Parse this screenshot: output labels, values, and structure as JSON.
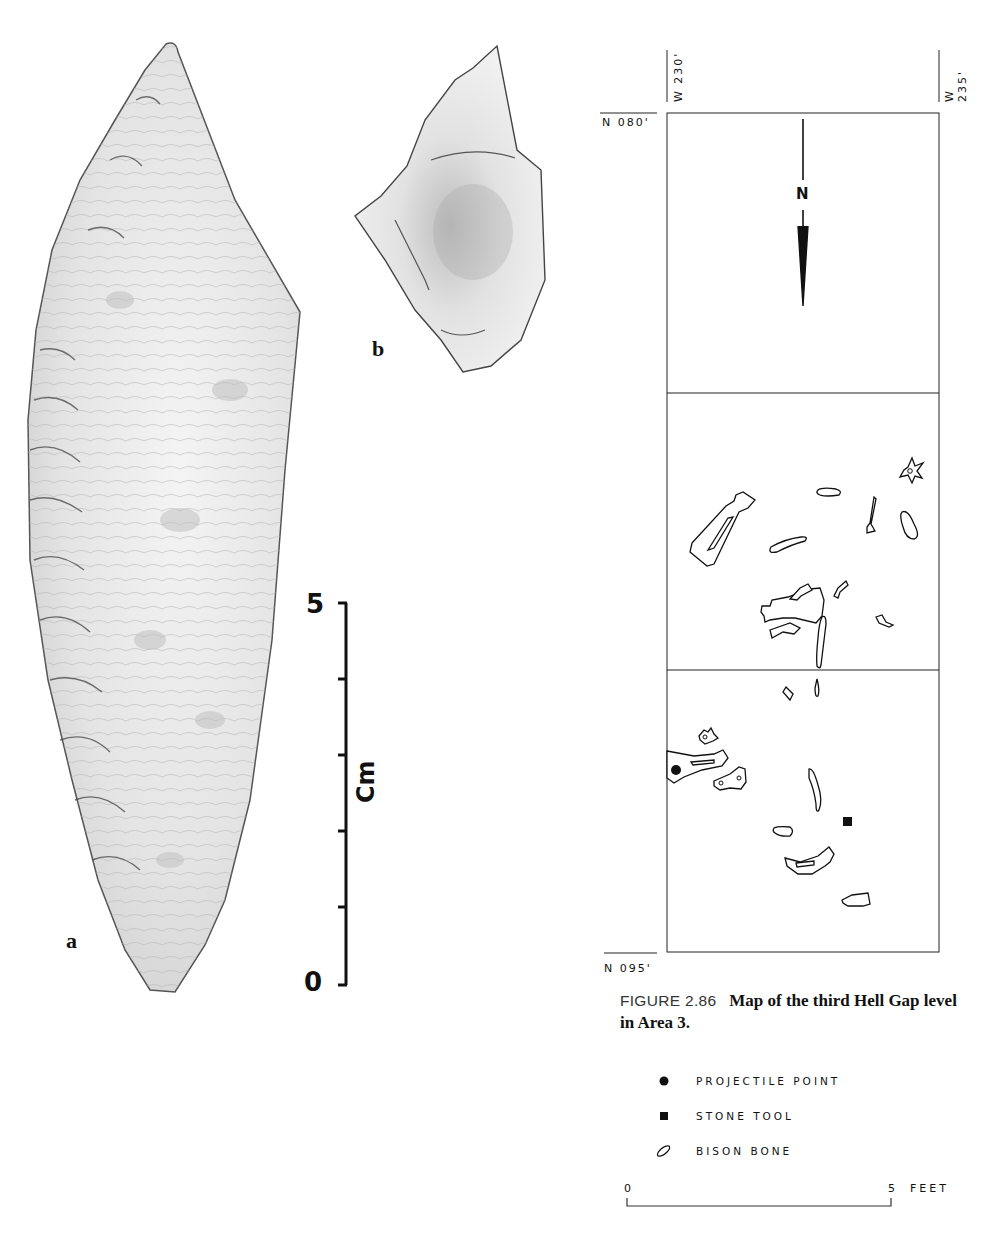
{
  "figure_left": {
    "artifact_a": {
      "label": "a"
    },
    "artifact_b": {
      "label": "b"
    },
    "scale_bar": {
      "top_label": "5",
      "bottom_label": "0",
      "unit": "Cm",
      "ticks": 6
    }
  },
  "map": {
    "column_labels": [
      "W 230'",
      "W 235'"
    ],
    "row_labels": {
      "top": "N 080'",
      "bottom": "N 095'"
    },
    "north_arrow": {
      "label": "N",
      "direction": "down"
    },
    "grid": {
      "columns": 1,
      "rows": 3
    },
    "features": [
      {
        "type": "bison-bone",
        "shape": "vertebra",
        "cell": 2
      },
      {
        "type": "bison-bone",
        "shape": "elongated",
        "cell": 2
      },
      {
        "type": "bison-bone",
        "shape": "rib-fragment",
        "cell": 2
      },
      {
        "type": "bison-bone",
        "shape": "small-rod",
        "cell": 2
      },
      {
        "type": "bison-bone",
        "shape": "metapodial",
        "cell": 2
      },
      {
        "type": "bison-bone",
        "shape": "rib",
        "cell": 2
      },
      {
        "type": "bison-bone",
        "shape": "long-bone",
        "cell": 2
      },
      {
        "type": "bison-bone",
        "shape": "small-fragment",
        "cell": 2
      },
      {
        "type": "bison-bone",
        "shape": "fragment",
        "cell": 2
      },
      {
        "type": "bison-bone",
        "shape": "rib-long",
        "cell": 2
      },
      {
        "type": "bison-bone",
        "shape": "fragment",
        "cell": 3
      },
      {
        "type": "projectile-point",
        "cell": 3
      },
      {
        "type": "bison-bone",
        "shape": "vertebra",
        "cell": 3
      },
      {
        "type": "bison-bone",
        "shape": "long-bone",
        "cell": 3
      },
      {
        "type": "bison-bone",
        "shape": "carpal",
        "cell": 3
      },
      {
        "type": "bison-bone",
        "shape": "rib",
        "cell": 3
      },
      {
        "type": "stone-tool",
        "cell": 3
      },
      {
        "type": "bison-bone",
        "shape": "small-oval",
        "cell": 3
      },
      {
        "type": "bison-bone",
        "shape": "mandible",
        "cell": 3
      },
      {
        "type": "bison-bone",
        "shape": "fragment",
        "cell": 3
      }
    ]
  },
  "caption": {
    "figure_number": "FIGURE 2.86",
    "text": "Map of the third Hell Gap level in Area 3."
  },
  "legend": {
    "items": [
      {
        "symbol": "filled-circle",
        "label": "PROJECTILE POINT"
      },
      {
        "symbol": "filled-square",
        "label": "STONE TOOL"
      },
      {
        "symbol": "bone-outline",
        "label": "BISON BONE"
      }
    ]
  },
  "map_scale": {
    "start_label": "0",
    "end_label": "5",
    "unit": "FEET"
  }
}
